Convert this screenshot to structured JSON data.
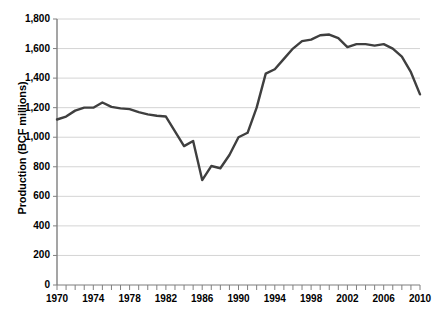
{
  "chart_data": {
    "type": "line",
    "title": "",
    "xlabel": "",
    "ylabel": "Production (BCF millions)",
    "xlim": [
      1970,
      2010
    ],
    "ylim": [
      0,
      1800
    ],
    "grid": true,
    "legend": "none",
    "line_color": "#3f3f3f",
    "grid_color": "#d4d4d4",
    "axis_color": "#808080",
    "y_ticks": [
      0,
      200,
      400,
      600,
      800,
      1000,
      1200,
      1400,
      1600,
      1800
    ],
    "y_tick_labels": [
      "0",
      "200",
      "400",
      "600",
      "800",
      "1,000",
      "1,200",
      "1,400",
      "1,600",
      "1,800"
    ],
    "x_ticks": [
      1970,
      1971,
      1972,
      1973,
      1974,
      1975,
      1976,
      1977,
      1978,
      1979,
      1980,
      1981,
      1982,
      1983,
      1984,
      1985,
      1986,
      1987,
      1988,
      1989,
      1990,
      1991,
      1992,
      1993,
      1994,
      1995,
      1996,
      1997,
      1998,
      1999,
      2000,
      2001,
      2002,
      2003,
      2004,
      2005,
      2006,
      2007,
      2008,
      2009,
      2010
    ],
    "x_tick_labels": [
      "1970",
      "1974",
      "1978",
      "1982",
      "1986",
      "1990",
      "1994",
      "1998",
      "2002",
      "2006",
      "2010"
    ],
    "x_labeled_ticks": [
      1970,
      1974,
      1978,
      1982,
      1986,
      1990,
      1994,
      1998,
      2002,
      2006,
      2010
    ],
    "x": [
      1970,
      1971,
      1972,
      1973,
      1974,
      1975,
      1976,
      1977,
      1978,
      1979,
      1980,
      1981,
      1982,
      1983,
      1984,
      1985,
      1986,
      1987,
      1988,
      1989,
      1990,
      1991,
      1992,
      1993,
      1994,
      1995,
      1996,
      1997,
      1998,
      1999,
      2000,
      2001,
      2002,
      2003,
      2004,
      2005,
      2006,
      2007,
      2008,
      2009,
      2010
    ],
    "values": [
      1120,
      1140,
      1180,
      1200,
      1200,
      1235,
      1205,
      1195,
      1190,
      1170,
      1155,
      1145,
      1140,
      1040,
      940,
      975,
      710,
      805,
      790,
      880,
      1000,
      1030,
      1200,
      1430,
      1460,
      1530,
      1600,
      1650,
      1660,
      1690,
      1695,
      1670,
      1610,
      1630,
      1630,
      1620,
      1630,
      1600,
      1545,
      1440,
      1290
    ]
  }
}
